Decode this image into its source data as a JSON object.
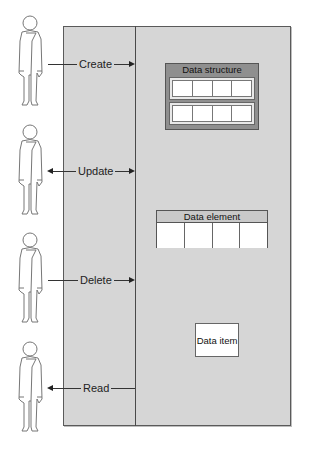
{
  "diagram": {
    "actors": [
      {
        "id": "actor-1",
        "top": 15
      },
      {
        "id": "actor-2",
        "top": 124
      },
      {
        "id": "actor-3",
        "top": 232
      },
      {
        "id": "actor-4",
        "top": 341
      }
    ],
    "operations": [
      {
        "label": "Create",
        "direction": "to-system"
      },
      {
        "label": "Update",
        "direction": "bidirectional"
      },
      {
        "label": "Delete",
        "direction": "to-system"
      },
      {
        "label": "Read",
        "direction": "to-user"
      }
    ],
    "data_structure": {
      "title": "Data structure",
      "rows": 2,
      "cells_per_row": 4
    },
    "data_element": {
      "title": "Data element",
      "cells": 4
    },
    "data_item": {
      "title": "Data item"
    },
    "colors": {
      "panel": "#d6d6d6",
      "border": "#555555",
      "structure_header": "#8f8f8f",
      "cell": "#ffffff"
    }
  }
}
